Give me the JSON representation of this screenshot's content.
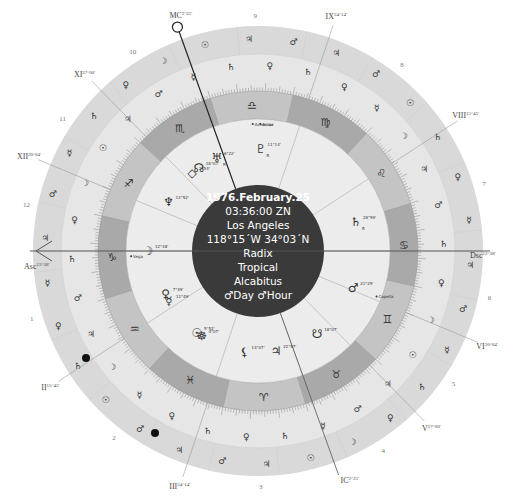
{
  "chart_info": {
    "date": "1976.February.25",
    "time": "03:36:00 ZN",
    "place": "Los Angeles",
    "coords": "118°15´W 34°03´N",
    "chart_type": "Radix",
    "zodiac": "Tropical",
    "house_system": "Alcabitus",
    "day_hour": "♂Day ♂Hour"
  },
  "colors": {
    "center_disc": "#3a3a3a",
    "inner_ring": "#ececec",
    "zodiac_band_dark": "#a9a9a9",
    "zodiac_band_light": "#c4c4c4",
    "outer_ring": "#e6e6e6",
    "outermost_ring": "#d9d9d9",
    "lines": "#555555"
  },
  "angles": {
    "asc": {
      "label": "Asc",
      "degree": "12°38'"
    },
    "dsc": {
      "label": "Dsc",
      "degree": "12°38'"
    },
    "mc": {
      "label": "MC",
      "degree": "2°25'"
    },
    "ic": {
      "label": "IC",
      "degree": "2°25'"
    }
  },
  "house_cusps": [
    {
      "label": "XI",
      "degree": "27°00'"
    },
    {
      "label": "XII",
      "degree": "20°04'"
    },
    {
      "label": "II",
      "degree": "15°45'"
    },
    {
      "label": "III",
      "degree": "24°14'"
    },
    {
      "label": "V",
      "degree": "27°00'"
    },
    {
      "label": "VI",
      "degree": "20°04'"
    },
    {
      "label": "VIII",
      "degree": "15°45'"
    },
    {
      "label": "IX",
      "degree": "24°14'"
    }
  ],
  "house_numbers": [
    "1",
    "2",
    "3",
    "4",
    "5",
    "6",
    "7",
    "8",
    "9",
    "10",
    "11",
    "12"
  ],
  "zodiac_signs": [
    {
      "name": "aries",
      "glyph": "♈"
    },
    {
      "name": "taurus",
      "glyph": "♉"
    },
    {
      "name": "gemini",
      "glyph": "♊"
    },
    {
      "name": "cancer",
      "glyph": "♋"
    },
    {
      "name": "leo",
      "glyph": "♌"
    },
    {
      "name": "virgo",
      "glyph": "♍"
    },
    {
      "name": "libra",
      "glyph": "♎"
    },
    {
      "name": "scorpio",
      "glyph": "♏"
    },
    {
      "name": "sagittarius",
      "glyph": "♐"
    },
    {
      "name": "capricorn",
      "glyph": "♑"
    },
    {
      "name": "aquarius",
      "glyph": "♒"
    },
    {
      "name": "pisces",
      "glyph": "♓"
    }
  ],
  "planets": [
    {
      "name": "moon",
      "glyph": "☽",
      "degree": "12°38'"
    },
    {
      "name": "neptune",
      "glyph": "♆",
      "degree": "13°52'"
    },
    {
      "name": "uranus",
      "glyph": "♅",
      "degree": "6°22'",
      "retro": "R"
    },
    {
      "name": "pluto",
      "glyph": "♇",
      "degree": "11°14'",
      "retro": "R"
    },
    {
      "name": "part-of-fortune",
      "glyph": "◇",
      "degree": "2°54'"
    },
    {
      "name": "north-node",
      "glyph": "☊",
      "degree": "18°07'"
    },
    {
      "name": "saturn",
      "glyph": "♄",
      "degree": "28°59'",
      "retro": "R"
    },
    {
      "name": "mars",
      "glyph": "♂",
      "degree": "21°29'"
    },
    {
      "name": "south-node",
      "glyph": "☋",
      "degree": "18°07'"
    },
    {
      "name": "jupiter",
      "glyph": "♃",
      "degree": "22°57'"
    },
    {
      "name": "lilith",
      "glyph": "⚸",
      "degree": "13°07'"
    },
    {
      "name": "sun",
      "glyph": "☉",
      "degree": "5°52'"
    },
    {
      "name": "wheel",
      "glyph": "☸",
      "degree": "4°07'"
    },
    {
      "name": "venus",
      "glyph": "♀",
      "degree": "7°49'"
    },
    {
      "name": "mercury",
      "glyph": "☿",
      "degree": "11°49'"
    }
  ],
  "fixed_stars": [
    {
      "name": "Vega"
    },
    {
      "name": "Capella"
    },
    {
      "name": "Acrux"
    },
    {
      "name": "Achernar"
    }
  ],
  "outer_ring_glyphs": [
    "♂",
    "♀",
    "♃",
    "♄",
    "☉",
    "☿",
    "☽",
    "♂",
    "♀",
    "♃",
    "♄",
    "☉",
    "☿",
    "☽",
    "♂",
    "♀",
    "♃",
    "♄",
    "☿",
    "♂",
    "♀",
    "♃",
    "♄",
    "☽",
    "☉",
    "☿",
    "♂",
    "♀",
    "♃",
    "♄",
    "♂",
    "♀",
    "♃",
    "♄",
    "☉",
    "☿",
    "☽",
    "♂",
    "♀",
    "♃",
    "♄",
    "☉",
    "☿",
    "☽",
    "♂",
    "♀",
    "♃",
    "♄",
    "☿",
    "♂",
    "♀",
    "♃",
    "♄",
    "☽",
    "☉",
    "☿",
    "♂",
    "♀",
    "♃",
    "♄"
  ]
}
